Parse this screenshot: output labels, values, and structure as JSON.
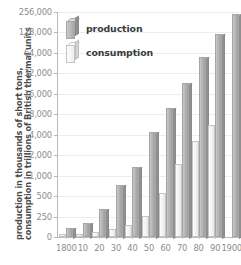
{
  "chart_data": {
    "type": "bar",
    "title": "",
    "xlabel": "",
    "ylabel": "production in thousands of short tons, consumption in trillions of British thermal units",
    "ylabel_line1": "production in thousands of short tons,",
    "ylabel_line2": "consumption in trillions of British thermal units",
    "yscale": "log",
    "ylim": [
      0,
      256000
    ],
    "grid": true,
    "legend_position": "top-left",
    "ytick_labels": [
      "256,000",
      "128,000",
      "64,000",
      "32,000",
      "16,000",
      "8,000",
      "4,000",
      "2,000",
      "1,000",
      "500",
      "250",
      "0"
    ],
    "ytick_values": [
      256000,
      128000,
      64000,
      32000,
      16000,
      8000,
      4000,
      2000,
      1000,
      500,
      250,
      0
    ],
    "categories": [
      "1800",
      "10",
      "20",
      "30",
      "40",
      "50",
      "60",
      "70",
      "80",
      "90",
      "1900"
    ],
    "series": [
      {
        "name": "production",
        "values": [
          108,
          176,
          330,
          730,
          1345,
          4400,
          10000,
          23000,
          56000,
          120000,
          240000
        ]
      },
      {
        "name": "consumption",
        "values": [
          36,
          42,
          60,
          95,
          150,
          260,
          560,
          1500,
          3200,
          5600,
          0
        ]
      }
    ]
  },
  "legend": {
    "items": [
      {
        "label": "production",
        "key": "prod"
      },
      {
        "label": "consumption",
        "key": "cons"
      }
    ]
  }
}
